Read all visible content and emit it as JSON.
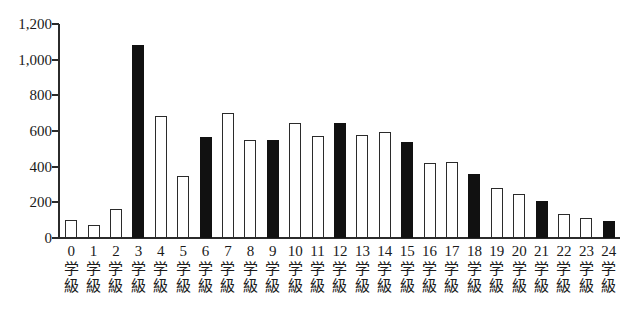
{
  "chart_data": {
    "type": "bar",
    "title": "",
    "subtitle": "",
    "xlabel": "",
    "ylabel": "",
    "ylim": [
      0,
      1200
    ],
    "grid": false,
    "legend_position": "none",
    "y_ticks": [
      0,
      200,
      400,
      600,
      800,
      1000,
      1200
    ],
    "y_tick_labels": [
      "0",
      "200",
      "400",
      "600",
      "800",
      "1,000",
      "1,200"
    ],
    "categories": [
      "0",
      "1",
      "2",
      "3",
      "4",
      "5",
      "6",
      "7",
      "8",
      "9",
      "10",
      "11",
      "12",
      "13",
      "14",
      "15",
      "16",
      "17",
      "18",
      "19",
      "20",
      "21",
      "22",
      "23",
      "24"
    ],
    "category_suffix_line1": "学",
    "category_suffix_line2": "級",
    "category_labels": [
      "0学級",
      "1学級",
      "2学級",
      "3学級",
      "4学級",
      "5学級",
      "6学級",
      "7学級",
      "8学級",
      "9学級",
      "10学級",
      "11学級",
      "12学級",
      "13学級",
      "14学級",
      "15学級",
      "16学級",
      "17学級",
      "18学級",
      "19学級",
      "20学級",
      "21学級",
      "22学級",
      "23学級",
      "24学級"
    ],
    "values": [
      100,
      75,
      160,
      1080,
      685,
      345,
      565,
      700,
      550,
      548,
      645,
      570,
      645,
      580,
      595,
      540,
      418,
      425,
      360,
      278,
      248,
      205,
      135,
      110,
      95
    ],
    "bar_styles": [
      "open",
      "open",
      "open",
      "filled",
      "open",
      "open",
      "filled",
      "open",
      "open",
      "filled",
      "open",
      "open",
      "filled",
      "open",
      "open",
      "filled",
      "open",
      "open",
      "filled",
      "open",
      "open",
      "filled",
      "open",
      "open",
      "filled"
    ],
    "colors": {
      "open_fill": "#ffffff",
      "filled_fill": "#111111",
      "bar_stroke": "#2b2b2b",
      "axis": "#2b2b2b",
      "text": "#1a1a1a"
    }
  }
}
